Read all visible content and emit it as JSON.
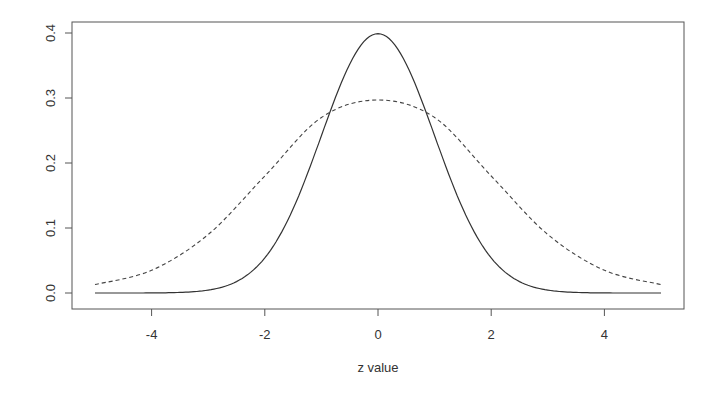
{
  "chart_data": {
    "type": "line",
    "title": "",
    "xlabel": "z value",
    "ylabel": "",
    "xlim": [
      -5,
      5
    ],
    "ylim": [
      0,
      0.4
    ],
    "x_ticks": [
      -4,
      -2,
      0,
      2,
      4
    ],
    "x_tick_labels": [
      "-4",
      "-2",
      "0",
      "2",
      "4"
    ],
    "y_ticks": [
      0.0,
      0.1,
      0.2,
      0.3,
      0.4
    ],
    "y_tick_labels": [
      "0.0",
      "0.1",
      "0.2",
      "0.3",
      "0.4"
    ],
    "grid": false,
    "legend": null,
    "x": [
      -5,
      -4,
      -3,
      -2,
      -1,
      0,
      1,
      2,
      3,
      4,
      5
    ],
    "series": [
      {
        "name": "solid",
        "style": "solid",
        "description": "standard normal density",
        "values": [
          0.0,
          0.0001,
          0.0044,
          0.054,
          0.242,
          0.399,
          0.242,
          0.054,
          0.0044,
          0.0001,
          0.0
        ]
      },
      {
        "name": "dashed",
        "style": "dashed",
        "description": "wider, heavier-tailed density",
        "values": [
          0.013,
          0.035,
          0.09,
          0.18,
          0.27,
          0.297,
          0.27,
          0.18,
          0.09,
          0.035,
          0.013
        ]
      }
    ]
  }
}
